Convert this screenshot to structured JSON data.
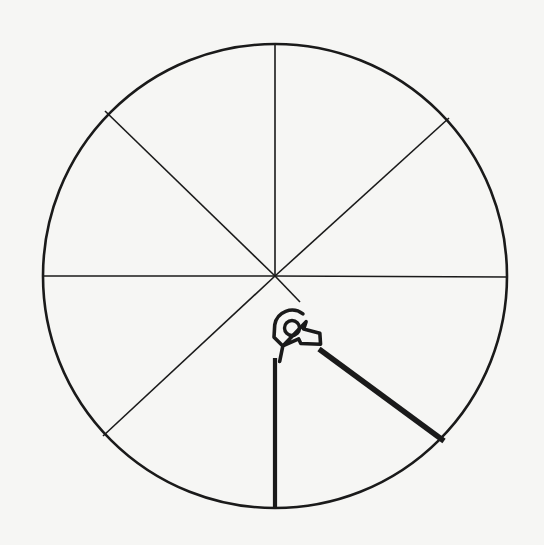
{
  "figure": {
    "title": "Circular dial with eight radial spokes and a pivoted cam latch",
    "caption": "",
    "canvas": {
      "width": 544,
      "height": 545
    },
    "background_color": "#f6f6f4",
    "ink_color": "#1a1a1a"
  },
  "geometry": {
    "circle": {
      "name": "outer-circle",
      "cx": 275,
      "cy": 276,
      "r": 232,
      "stroke_width": 2.6,
      "extremes": {
        "top_y": 44,
        "bottom_y": 508,
        "left_x": 43,
        "right_x": 507
      }
    },
    "spokes": [
      {
        "name": "spoke-north",
        "angle_deg": 90,
        "from": "center",
        "to": [
          275,
          44
        ],
        "stroke_width": 1.6,
        "weight": "thin"
      },
      {
        "name": "spoke-west",
        "angle_deg": 180,
        "from": "center",
        "to": [
          43,
          276
        ],
        "stroke_width": 1.6,
        "weight": "thin"
      },
      {
        "name": "spoke-east",
        "angle_deg": 0,
        "from": "center",
        "to": [
          507,
          277
        ],
        "stroke_width": 1.6,
        "weight": "thin"
      },
      {
        "name": "spoke-northwest",
        "angle_deg": 135,
        "from": "center",
        "to": [
          105,
          111
        ],
        "stroke_width": 1.6,
        "weight": "thin"
      },
      {
        "name": "spoke-northeast",
        "angle_deg": 45,
        "from": "center",
        "to": [
          449,
          118
        ],
        "stroke_width": 1.6,
        "weight": "thin"
      },
      {
        "name": "spoke-southwest",
        "angle_deg": 225,
        "from": "center",
        "to": [
          103,
          436
        ],
        "stroke_width": 1.6,
        "weight": "thin"
      },
      {
        "name": "spoke-southeast-thin",
        "angle_deg": 315,
        "from": "center",
        "to": [
          300,
          302
        ],
        "stroke_width": 1.6,
        "weight": "thin"
      }
    ],
    "heavy_lines": [
      {
        "name": "pointer-vertical-south",
        "from": [
          275,
          358
        ],
        "to": [
          275,
          508
        ],
        "stroke_width": 4.2,
        "weight": "heavy"
      },
      {
        "name": "pointer-diagonal-southeast",
        "from": [
          319,
          349
        ],
        "to": [
          444,
          441
        ],
        "stroke_width": 5.4,
        "weight": "heavy"
      }
    ],
    "cam_latch": {
      "name": "cam-latch-body",
      "pivot_hole": {
        "name": "pivot-hole",
        "cx": 292,
        "cy": 328,
        "r": 7.5,
        "stroke_width": 3.4
      },
      "outline_stroke_width": 3.6,
      "bounding_box": {
        "x": 268,
        "y": 304,
        "width": 58,
        "height": 62
      },
      "description": "Rounded cam head around the pivot hole with a tapered tail descending to the vertical pointer and a stepped notch arm reaching right into the heavy diagonal."
    }
  },
  "labels": {
    "annotations": []
  }
}
